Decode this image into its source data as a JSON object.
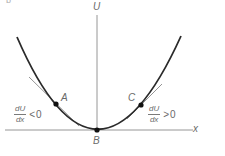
{
  "figure": {
    "corner_label": "b",
    "axes": {
      "y_label": "U",
      "x_label": "x"
    },
    "points": [
      {
        "id": "A",
        "label": "A",
        "x": 56,
        "y": 104
      },
      {
        "id": "B",
        "label": "B",
        "x": 97,
        "y": 130
      },
      {
        "id": "C",
        "label": "C",
        "x": 141,
        "y": 105
      }
    ],
    "annotations": {
      "left": {
        "numerator": "dU",
        "denominator": "dx",
        "relation": "<",
        "value": "0"
      },
      "right": {
        "numerator": "dU",
        "denominator": "dx",
        "relation": ">",
        "value": "0"
      }
    },
    "colors": {
      "curve": "#2a2a2a",
      "axis": "#8a8a8a",
      "tangent": "#7a7a7a",
      "point": "#111111",
      "text": "#6a6a6a"
    }
  }
}
